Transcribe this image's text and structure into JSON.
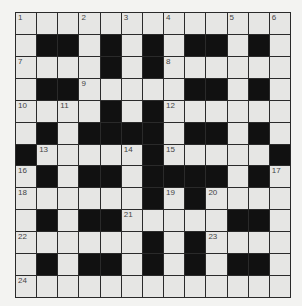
{
  "puzzle": {
    "rows": 13,
    "cols": 13,
    "colors": {
      "white_cell": "#e6e6e4",
      "black_cell": "#111111",
      "grid_line": "#2a2a2a",
      "number_text": "#444444",
      "background": "#f3f3f1"
    },
    "layout": [
      ".............",
      ".##.#.#.##.#.",
      "....#.#......",
      ".##.....##.#.",
      "....#.#......",
      ".#.####.##.#.",
      "#.....#.....#",
      ".#.##.####.#.",
      "......#.#....",
      ".#.##.....##.",
      "......#.#....",
      ".#.##.#.#.##.",
      "............."
    ],
    "numbers": [
      {
        "row": 0,
        "col": 0,
        "n": "1"
      },
      {
        "row": 0,
        "col": 3,
        "n": "2"
      },
      {
        "row": 0,
        "col": 5,
        "n": "3"
      },
      {
        "row": 0,
        "col": 7,
        "n": "4"
      },
      {
        "row": 0,
        "col": 10,
        "n": "5"
      },
      {
        "row": 0,
        "col": 12,
        "n": "6"
      },
      {
        "row": 2,
        "col": 0,
        "n": "7"
      },
      {
        "row": 2,
        "col": 7,
        "n": "8"
      },
      {
        "row": 3,
        "col": 3,
        "n": "9"
      },
      {
        "row": 4,
        "col": 0,
        "n": "10"
      },
      {
        "row": 4,
        "col": 2,
        "n": "11"
      },
      {
        "row": 4,
        "col": 7,
        "n": "12"
      },
      {
        "row": 6,
        "col": 1,
        "n": "13"
      },
      {
        "row": 6,
        "col": 5,
        "n": "14"
      },
      {
        "row": 6,
        "col": 7,
        "n": "15"
      },
      {
        "row": 7,
        "col": 0,
        "n": "16"
      },
      {
        "row": 7,
        "col": 12,
        "n": "17"
      },
      {
        "row": 8,
        "col": 0,
        "n": "18"
      },
      {
        "row": 8,
        "col": 7,
        "n": "19"
      },
      {
        "row": 8,
        "col": 9,
        "n": "20"
      },
      {
        "row": 9,
        "col": 5,
        "n": "21"
      },
      {
        "row": 10,
        "col": 0,
        "n": "22"
      },
      {
        "row": 10,
        "col": 9,
        "n": "23"
      },
      {
        "row": 12,
        "col": 0,
        "n": "24"
      }
    ]
  }
}
